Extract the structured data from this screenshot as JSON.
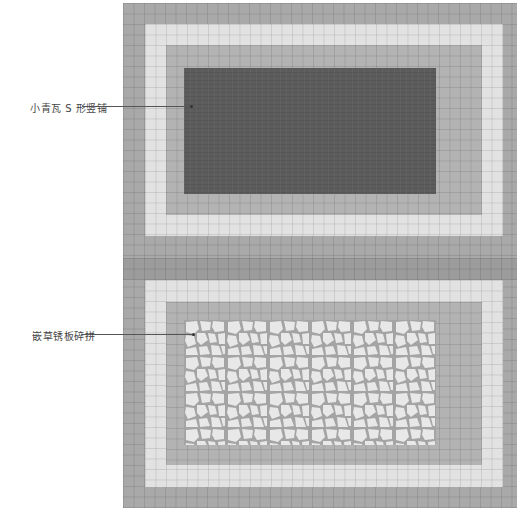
{
  "labels": [
    {
      "text": "小青瓦 S 形竖铺",
      "x": 30,
      "y": 100,
      "line_x1": 82,
      "line_x2": 192,
      "line_y": 106
    },
    {
      "text": "嵌草锈板碎拼",
      "x": 32,
      "y": 328,
      "line_x1": 81,
      "line_x2": 194,
      "line_y": 334
    }
  ],
  "colors": {
    "outer_band": "#a9a9a9",
    "light_band": "#e2e2e2",
    "mid_band": "#b3b3b3",
    "divider_band": "#9c9c9c",
    "slate_fill": "#5c5c5c",
    "paving_grout": "#a4a4a4",
    "paving_stone": "#e8e8e8"
  }
}
